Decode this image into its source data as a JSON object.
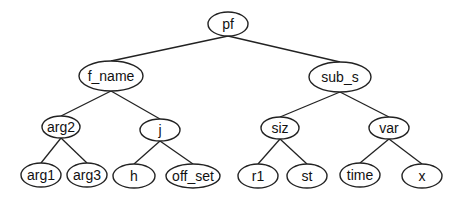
{
  "diagram": {
    "type": "tree",
    "stroke_color": "#222222",
    "background": "#ffffff",
    "nodes": [
      {
        "id": "pf",
        "label": "pf",
        "cx": 228,
        "cy": 24,
        "rx": 20,
        "ry": 12
      },
      {
        "id": "f_name",
        "label": "f_name",
        "cx": 111,
        "cy": 76,
        "rx": 32,
        "ry": 15
      },
      {
        "id": "sub_s",
        "label": "sub_s",
        "cx": 340,
        "cy": 77,
        "rx": 31,
        "ry": 15
      },
      {
        "id": "arg2",
        "label": "arg2",
        "cx": 61,
        "cy": 127,
        "rx": 19,
        "ry": 11
      },
      {
        "id": "j",
        "label": "j",
        "cx": 160,
        "cy": 130,
        "rx": 20,
        "ry": 11
      },
      {
        "id": "siz",
        "label": "siz",
        "cx": 280,
        "cy": 128,
        "rx": 19,
        "ry": 11
      },
      {
        "id": "var",
        "label": "var",
        "cx": 389,
        "cy": 128,
        "rx": 20,
        "ry": 11
      },
      {
        "id": "arg1",
        "label": "arg1",
        "cx": 41,
        "cy": 175,
        "rx": 20,
        "ry": 12
      },
      {
        "id": "arg3",
        "label": "arg3",
        "cx": 87,
        "cy": 175,
        "rx": 20,
        "ry": 12
      },
      {
        "id": "h",
        "label": "h",
        "cx": 134,
        "cy": 176,
        "rx": 21,
        "ry": 12
      },
      {
        "id": "off_set",
        "label": "off_set",
        "cx": 193,
        "cy": 176,
        "rx": 27,
        "ry": 12
      },
      {
        "id": "r1",
        "label": "r1",
        "cx": 258,
        "cy": 176,
        "rx": 20,
        "ry": 12
      },
      {
        "id": "st",
        "label": "st",
        "cx": 307,
        "cy": 176,
        "rx": 20,
        "ry": 12
      },
      {
        "id": "time",
        "label": "time",
        "cx": 360,
        "cy": 175,
        "rx": 20,
        "ry": 12
      },
      {
        "id": "x",
        "label": "x",
        "cx": 422,
        "cy": 176,
        "rx": 20,
        "ry": 12
      }
    ],
    "edges": [
      [
        "pf",
        "f_name"
      ],
      [
        "pf",
        "sub_s"
      ],
      [
        "f_name",
        "arg2"
      ],
      [
        "f_name",
        "j"
      ],
      [
        "sub_s",
        "siz"
      ],
      [
        "sub_s",
        "var"
      ],
      [
        "arg2",
        "arg1"
      ],
      [
        "arg2",
        "arg3"
      ],
      [
        "j",
        "h"
      ],
      [
        "j",
        "off_set"
      ],
      [
        "siz",
        "r1"
      ],
      [
        "siz",
        "st"
      ],
      [
        "var",
        "time"
      ],
      [
        "var",
        "x"
      ]
    ]
  }
}
